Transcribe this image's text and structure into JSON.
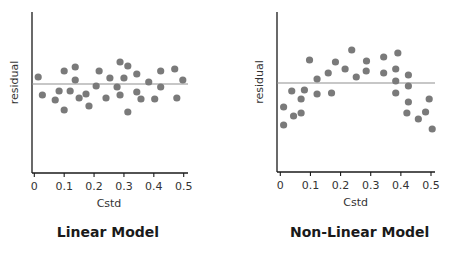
{
  "colors": {
    "axis": "#1a1a1a",
    "dot": "#7a7a7a",
    "zero_line": "#909090",
    "text": "#333333"
  },
  "chart_data": [
    {
      "type": "scatter",
      "title": "Linear Model",
      "xlabel": "Cstd",
      "ylabel": "residual",
      "xlim": [
        0,
        0.5
      ],
      "x_ticks": [
        "0",
        "0.1",
        "0.2",
        "0.3",
        "0.4",
        "0.5"
      ],
      "y_ticks": [],
      "reference_line": 0,
      "grid": false,
      "points": [
        {
          "x": 0.013,
          "y": 0.7
        },
        {
          "x": 0.027,
          "y": -1.1
        },
        {
          "x": 0.07,
          "y": -1.6
        },
        {
          "x": 0.083,
          "y": -0.7
        },
        {
          "x": 0.1,
          "y": 1.3
        },
        {
          "x": 0.1,
          "y": -2.6
        },
        {
          "x": 0.12,
          "y": -0.7
        },
        {
          "x": 0.137,
          "y": 1.7
        },
        {
          "x": 0.137,
          "y": 0.4
        },
        {
          "x": 0.15,
          "y": -1.4
        },
        {
          "x": 0.173,
          "y": -1.0
        },
        {
          "x": 0.183,
          "y": -2.2
        },
        {
          "x": 0.207,
          "y": -0.2
        },
        {
          "x": 0.217,
          "y": 1.3
        },
        {
          "x": 0.24,
          "y": -1.4
        },
        {
          "x": 0.253,
          "y": 0.6
        },
        {
          "x": 0.277,
          "y": -0.3
        },
        {
          "x": 0.287,
          "y": 2.2
        },
        {
          "x": 0.287,
          "y": -1.1
        },
        {
          "x": 0.3,
          "y": 0.6
        },
        {
          "x": 0.313,
          "y": 1.8
        },
        {
          "x": 0.313,
          "y": -2.8
        },
        {
          "x": 0.343,
          "y": 1.0
        },
        {
          "x": 0.343,
          "y": -0.8
        },
        {
          "x": 0.357,
          "y": -1.5
        },
        {
          "x": 0.383,
          "y": 0.2
        },
        {
          "x": 0.403,
          "y": -1.5
        },
        {
          "x": 0.423,
          "y": 1.3
        },
        {
          "x": 0.423,
          "y": -0.3
        },
        {
          "x": 0.47,
          "y": 1.5
        },
        {
          "x": 0.477,
          "y": -1.4
        },
        {
          "x": 0.497,
          "y": 0.4
        }
      ]
    },
    {
      "type": "scatter",
      "title": "Non-Linear Model",
      "xlabel": "Cstd",
      "ylabel": "residual",
      "xlim": [
        0,
        0.5
      ],
      "x_ticks": [
        "0",
        "0.1",
        "0.2",
        "0.3",
        "0.4",
        "0.5"
      ],
      "y_ticks": [],
      "reference_line": 0,
      "grid": false,
      "points": [
        {
          "x": 0.011,
          "y": -2.4
        },
        {
          "x": 0.011,
          "y": -4.2
        },
        {
          "x": 0.038,
          "y": -0.8
        },
        {
          "x": 0.044,
          "y": -3.3
        },
        {
          "x": 0.069,
          "y": -1.6
        },
        {
          "x": 0.069,
          "y": -3.0
        },
        {
          "x": 0.08,
          "y": -0.7
        },
        {
          "x": 0.097,
          "y": 2.3
        },
        {
          "x": 0.122,
          "y": 0.4
        },
        {
          "x": 0.122,
          "y": -1.1
        },
        {
          "x": 0.159,
          "y": 1.0
        },
        {
          "x": 0.17,
          "y": -1.0
        },
        {
          "x": 0.183,
          "y": 2.1
        },
        {
          "x": 0.215,
          "y": 1.4
        },
        {
          "x": 0.237,
          "y": 3.3
        },
        {
          "x": 0.252,
          "y": 0.6
        },
        {
          "x": 0.285,
          "y": 1.2
        },
        {
          "x": 0.286,
          "y": 2.2
        },
        {
          "x": 0.343,
          "y": 2.6
        },
        {
          "x": 0.343,
          "y": 1.0
        },
        {
          "x": 0.383,
          "y": 1.4
        },
        {
          "x": 0.383,
          "y": 0.2
        },
        {
          "x": 0.383,
          "y": -1.0
        },
        {
          "x": 0.39,
          "y": 3.0
        },
        {
          "x": 0.425,
          "y": 0.8
        },
        {
          "x": 0.425,
          "y": -0.3
        },
        {
          "x": 0.425,
          "y": -1.9
        },
        {
          "x": 0.42,
          "y": -3.0
        },
        {
          "x": 0.458,
          "y": -3.6
        },
        {
          "x": 0.482,
          "y": -2.9
        },
        {
          "x": 0.494,
          "y": -1.6
        },
        {
          "x": 0.504,
          "y": -4.6
        }
      ]
    }
  ],
  "panels": [
    {
      "title": "Linear Model",
      "xlabel": "Cstd",
      "ylabel": "residual"
    },
    {
      "title": "Non-Linear Model",
      "xlabel": "Cstd",
      "ylabel": "residual"
    }
  ]
}
